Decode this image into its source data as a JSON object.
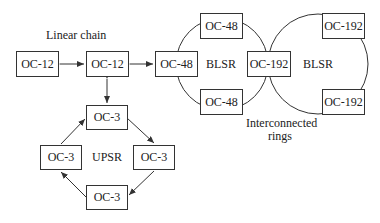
{
  "labels": {
    "linear_chain": "Linear chain",
    "blsr_left": "BLSR",
    "blsr_right": "BLSR",
    "upsr": "UPSR",
    "interconnected_line1": "Interconnected",
    "interconnected_line2": "rings"
  },
  "nodes": {
    "linear_left": "OC-12",
    "linear_mid": "OC-12",
    "blsr1_left": "OC-48",
    "blsr1_top": "OC-48",
    "blsr1_bottom": "OC-48",
    "shared_oc192": "OC-192",
    "blsr2_top": "OC-192",
    "blsr2_bottom": "OC-192",
    "upsr_top": "OC-3",
    "upsr_left": "OC-3",
    "upsr_right": "OC-3",
    "upsr_bottom": "OC-3"
  },
  "colors": {
    "line": "#333333",
    "text": "#222222"
  }
}
